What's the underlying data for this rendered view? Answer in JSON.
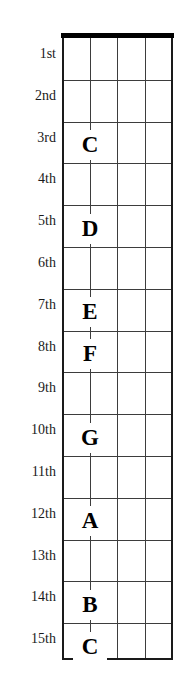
{
  "diagram": {
    "type": "guitar-fretboard-note-chart",
    "colors": {
      "nut": "#000000",
      "grid_line": "#3d3d3d",
      "board_edge": "#1a1a1a",
      "background": "#ffffff",
      "text": "#000000",
      "label_text": "#1a1a1a"
    },
    "fret_count": 15,
    "string_count": 5,
    "fret_labels": [
      {
        "label": "1st",
        "index": 1
      },
      {
        "label": "2nd",
        "index": 2
      },
      {
        "label": "3rd",
        "index": 3
      },
      {
        "label": "4th",
        "index": 4
      },
      {
        "label": "5th",
        "index": 5
      },
      {
        "label": "6th",
        "index": 6
      },
      {
        "label": "7th",
        "index": 7
      },
      {
        "label": "8th",
        "index": 8
      },
      {
        "label": "9th",
        "index": 9
      },
      {
        "label": "10th",
        "index": 10
      },
      {
        "label": "11th",
        "index": 11
      },
      {
        "label": "12th",
        "index": 12
      },
      {
        "label": "13th",
        "index": 13
      },
      {
        "label": "14th",
        "index": 14
      },
      {
        "label": "15th",
        "index": 15
      }
    ],
    "notes": [
      {
        "letter": "C",
        "fret": 3,
        "string": 2
      },
      {
        "letter": "D",
        "fret": 5,
        "string": 2
      },
      {
        "letter": "E",
        "fret": 7,
        "string": 2
      },
      {
        "letter": "F",
        "fret": 8,
        "string": 2
      },
      {
        "letter": "G",
        "fret": 10,
        "string": 2
      },
      {
        "letter": "A",
        "fret": 12,
        "string": 2
      },
      {
        "letter": "B",
        "fret": 14,
        "string": 2
      },
      {
        "letter": "C",
        "fret": 15,
        "string": 2
      }
    ]
  }
}
